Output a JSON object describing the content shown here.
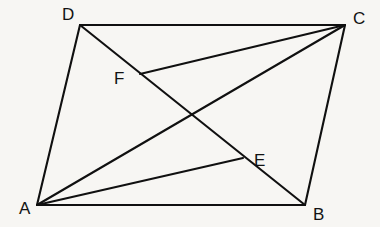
{
  "figure": {
    "kind": "geometry-diagram",
    "shape_name": "parallelogram",
    "background_color": "#f7f6f3",
    "line_color": "#101010",
    "label_color": "#121212",
    "canvas": {
      "width": 380,
      "height": 227
    },
    "points": [
      {
        "id": "A",
        "label": "A",
        "x": 37,
        "y": 205,
        "label_x": 19,
        "label_y": 214,
        "role": "vertex"
      },
      {
        "id": "B",
        "label": "B",
        "x": 305,
        "y": 205,
        "label_x": 313,
        "label_y": 220,
        "role": "vertex"
      },
      {
        "id": "C",
        "label": "C",
        "x": 345,
        "y": 25,
        "label_x": 353,
        "label_y": 24,
        "role": "vertex"
      },
      {
        "id": "D",
        "label": "D",
        "x": 80,
        "y": 25,
        "label_x": 62,
        "label_y": 20,
        "role": "vertex"
      },
      {
        "id": "E",
        "label": "E",
        "x": 243,
        "y": 158,
        "label_x": 254,
        "label_y": 166,
        "role": "intersection"
      },
      {
        "id": "F",
        "label": "F",
        "x": 140,
        "y": 74,
        "label_x": 114,
        "label_y": 84,
        "role": "intersection"
      }
    ],
    "segments": [
      {
        "id": "AB",
        "from": "A",
        "to": "B",
        "type": "edge",
        "name": "side-ab"
      },
      {
        "id": "BC",
        "from": "B",
        "to": "C",
        "type": "edge",
        "name": "side-bc"
      },
      {
        "id": "CD",
        "from": "C",
        "to": "D",
        "type": "edge",
        "name": "side-cd"
      },
      {
        "id": "DA",
        "from": "D",
        "to": "A",
        "type": "edge",
        "name": "side-da"
      },
      {
        "id": "DB",
        "from": "D",
        "to": "B",
        "type": "cevian",
        "name": "segment-db-through-f-and-e"
      },
      {
        "id": "AC",
        "from": "A",
        "to": "C",
        "type": "cevian",
        "name": "segment-ac-through-f-and-e"
      },
      {
        "id": "AE",
        "from": "A",
        "to": "E",
        "type": "cevian",
        "name": "segment-a-to-e"
      },
      {
        "id": "FC",
        "from": "F",
        "to": "C",
        "type": "cevian",
        "name": "segment-f-to-c"
      }
    ]
  }
}
